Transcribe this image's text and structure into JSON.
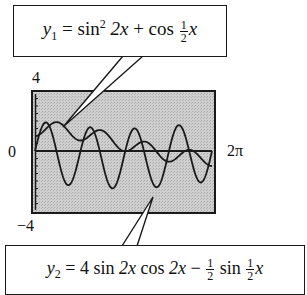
{
  "chart_data": {
    "type": "line",
    "title": "",
    "xlabel": "",
    "ylabel": "",
    "xlim": [
      0,
      6.2832
    ],
    "ylim": [
      -4,
      4
    ],
    "x_tick_labels": [
      "0",
      "2π"
    ],
    "y_tick_labels": [
      "4",
      "0",
      "−4"
    ],
    "grid": false,
    "background": "#c8c8c8",
    "series": [
      {
        "name": "y1",
        "equation": "y1 = sin^2 2x + cos (1/2)x",
        "expression": "sin(2x)^2 + cos(x/2)",
        "samples": {
          "x": [
            0,
            0.785,
            1.571,
            2.356,
            3.142,
            3.927,
            4.712,
            5.498,
            6.283
          ],
          "y": [
            1.0,
            1.92,
            0.71,
            1.38,
            0.0,
            0.62,
            -0.71,
            0.62,
            -1.0
          ]
        }
      },
      {
        "name": "y2",
        "equation": "y2 = 4 sin 2x cos 2x − (1/2) sin (1/2)x",
        "expression": "4*sin(2x)*cos(2x) - 0.5*sin(x/2)",
        "samples": {
          "x": [
            0,
            0.393,
            0.785,
            1.178,
            1.571,
            1.963,
            2.356,
            2.749,
            3.142,
            3.534,
            3.927,
            4.32,
            4.712,
            5.105,
            5.498,
            5.89,
            6.283
          ],
          "y": [
            0.0,
            1.9,
            -0.19,
            -2.28,
            -0.35,
            1.58,
            -0.46,
            -2.49,
            -0.5,
            1.51,
            -0.46,
            -2.42,
            -0.35,
            1.72,
            -0.19,
            -2.1,
            0.0
          ]
        }
      }
    ]
  },
  "labels": {
    "y_max": "4",
    "y_zero": "0",
    "y_min": "−4",
    "x_max": "2π"
  },
  "callouts": {
    "y1": {
      "var": "y",
      "sub": "1",
      "eq": "=",
      "fn1": "sin",
      "sup": "2",
      "arg1": "2x",
      "plus": "+",
      "fn2": "cos",
      "frac_num": "1",
      "frac_den": "2",
      "arg2": "x"
    },
    "y2": {
      "var": "y",
      "sub": "2",
      "eq": "=",
      "coef": "4",
      "fn1": "sin",
      "arg1": "2x",
      "fn2": "cos",
      "arg2": "2x",
      "minus": "−",
      "frac1_num": "1",
      "frac1_den": "2",
      "fn3": "sin",
      "frac2_num": "1",
      "frac2_den": "2",
      "arg3": "x"
    }
  }
}
